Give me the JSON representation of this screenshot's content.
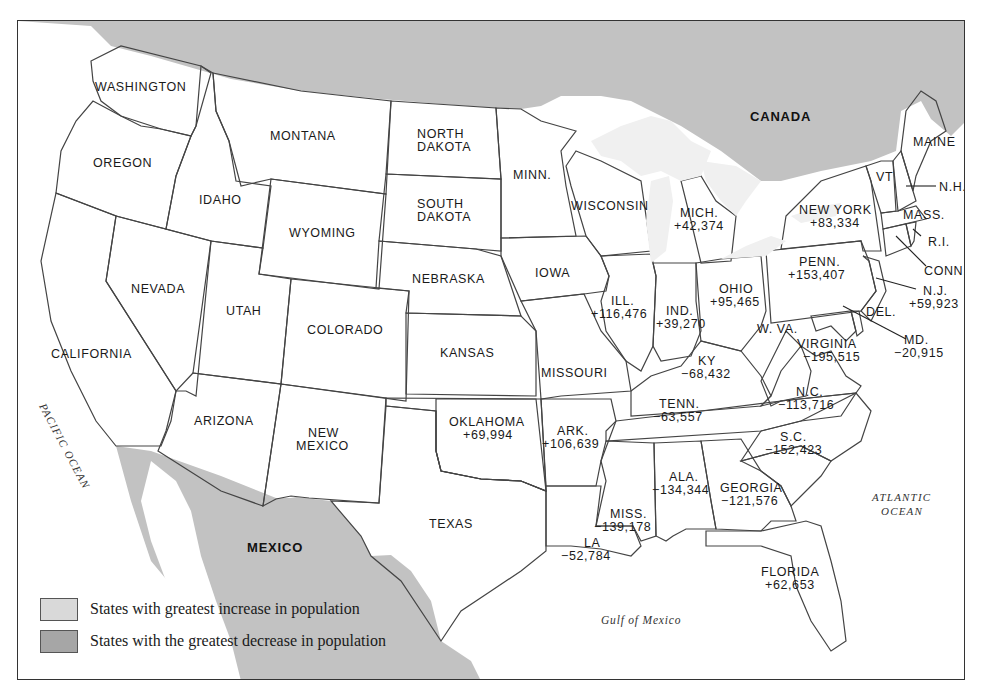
{
  "map": {
    "countries": {
      "canada": "CANADA",
      "mexico": "MEXICO"
    },
    "water": {
      "pacific": "PACIFIC OCEAN",
      "atlantic_line1": "ATLANTIC",
      "atlantic_line2": "OCEAN",
      "gulf": "Gulf of Mexico"
    },
    "colors": {
      "background_water": "#ffffff",
      "foreign_land": "#c2c2c2",
      "state_neutral": "#e6e6e6",
      "state_increase": "#d6d6d6",
      "state_decrease": "#a6a6a6",
      "lakes": "#f2f2f2",
      "border": "#444444"
    },
    "states": {
      "washington": {
        "name": "WASHINGTON"
      },
      "oregon": {
        "name": "OREGON"
      },
      "california": {
        "name": "CALIFORNIA"
      },
      "nevada": {
        "name": "NEVADA"
      },
      "idaho": {
        "name": "IDAHO"
      },
      "montana": {
        "name": "MONTANA"
      },
      "wyoming": {
        "name": "WYOMING"
      },
      "utah": {
        "name": "UTAH"
      },
      "arizona": {
        "name": "ARIZONA"
      },
      "colorado": {
        "name": "COLORADO"
      },
      "new_mexico": {
        "name_line1": "NEW",
        "name_line2": "MEXICO"
      },
      "north_dakota": {
        "name_line1": "NORTH",
        "name_line2": "DAKOTA"
      },
      "south_dakota": {
        "name_line1": "SOUTH",
        "name_line2": "DAKOTA"
      },
      "nebraska": {
        "name": "NEBRASKA"
      },
      "kansas": {
        "name": "KANSAS"
      },
      "oklahoma": {
        "name": "OKLAHOMA",
        "change": "+69,994"
      },
      "texas": {
        "name": "TEXAS"
      },
      "minnesota": {
        "name": "MINN."
      },
      "iowa": {
        "name": "IOWA"
      },
      "missouri": {
        "name": "MISSOURI"
      },
      "arkansas": {
        "name": "ARK.",
        "change": "+106,639"
      },
      "louisiana": {
        "name": "LA",
        "change": "−52,784"
      },
      "wisconsin": {
        "name": "WISCONSIN"
      },
      "illinois": {
        "name": "ILL.",
        "change": "+116,476"
      },
      "michigan": {
        "name": "MICH.",
        "change": "+42,374"
      },
      "indiana": {
        "name": "IND.",
        "change": "+39,270"
      },
      "ohio": {
        "name": "OHIO",
        "change": "+95,465"
      },
      "kentucky": {
        "name": "KY",
        "change": "−68,432"
      },
      "tennessee": {
        "name": "TENN.",
        "change": "−63,557"
      },
      "mississippi": {
        "name": "MISS.",
        "change": "−139,178"
      },
      "alabama": {
        "name": "ALA.",
        "change": "−134,344"
      },
      "georgia": {
        "name": "GEORGIA",
        "change": "−121,576"
      },
      "florida": {
        "name": "FLORIDA",
        "change": "+62,653"
      },
      "south_carolina": {
        "name": "S.C.",
        "change": "−152,423"
      },
      "north_carolina": {
        "name": "N.C.",
        "change": "−113,716"
      },
      "virginia": {
        "name": "VIRGINIA",
        "change": "−195,515"
      },
      "west_virginia": {
        "name": "W. VA."
      },
      "maryland": {
        "name": "MD.",
        "change": "−20,915"
      },
      "delaware": {
        "name": "DEL."
      },
      "pennsylvania": {
        "name": "PENN.",
        "change": "+153,407"
      },
      "new_jersey": {
        "name": "N.J.",
        "change": "+59,923"
      },
      "new_york": {
        "name": "NEW YORK",
        "change": "+83,334"
      },
      "connecticut": {
        "name": "CONN."
      },
      "rhode_island": {
        "name": "R.I."
      },
      "massachusetts": {
        "name": "MASS."
      },
      "vermont": {
        "name": "VT"
      },
      "new_hampshire": {
        "name": "N.H."
      },
      "maine": {
        "name": "MAINE"
      }
    }
  },
  "legend": {
    "items": [
      {
        "label": "States with greatest increase in population",
        "color": "#d9d9d9"
      },
      {
        "label": "States with the greatest decrease in population",
        "color": "#a6a6a6"
      }
    ]
  }
}
